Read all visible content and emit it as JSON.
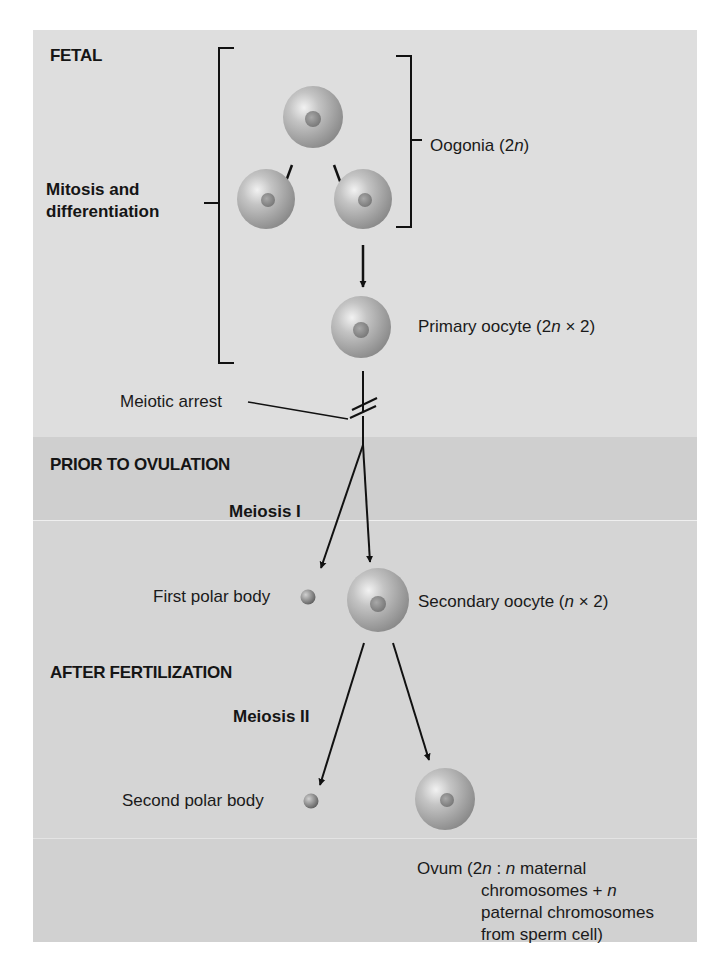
{
  "diagram": {
    "sections": {
      "fetal": "FETAL",
      "prior": "PRIOR TO OVULATION",
      "after": "AFTER FERTILIZATION"
    },
    "phases": {
      "mitosis_line1": "Mitosis and",
      "mitosis_line2": "differentiation",
      "meiosis1": "Meiosis I",
      "meiosis2": "Meiosis II"
    },
    "labels": {
      "oogonia_prefix": "Oogonia (2",
      "oogonia_n": "n",
      "oogonia_suffix": ")",
      "primary_prefix": "Primary oocyte (2",
      "primary_n": "n",
      "primary_suffix": " × 2)",
      "meiotic_arrest": "Meiotic arrest",
      "first_polar": "First polar body",
      "secondary_prefix": "Secondary oocyte (",
      "secondary_n": "n",
      "secondary_suffix": " × 2)",
      "second_polar": "Second polar body",
      "ovum_l1_a": "Ovum (2",
      "ovum_l1_n1": "n",
      "ovum_l1_b": " : ",
      "ovum_l1_n2": "n",
      "ovum_l1_c": " maternal",
      "ovum_l2_a": "chromosomes + ",
      "ovum_l2_n": "n",
      "ovum_l3": "paternal chromosomes",
      "ovum_l4": "from sperm cell)"
    },
    "colors": {
      "fetal_band": "#dedede",
      "prior_band": "#cfcfcf",
      "lower_band": "#d5d5d5",
      "cell_light": "#d8d8d8",
      "cell_dark": "#8e8e8e",
      "line": "#111111"
    }
  }
}
